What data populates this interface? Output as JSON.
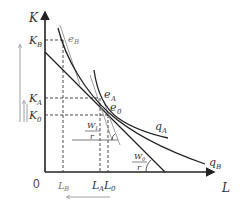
{
  "diagram": {
    "type": "isoquant-isocost",
    "axes": {
      "y_label": "K",
      "x_label": "L",
      "origin_label": "0"
    },
    "y_ticks": [
      {
        "base": "K",
        "sub": "B"
      },
      {
        "base": "K",
        "sub": "A"
      },
      {
        "base": "K",
        "sub": "0"
      }
    ],
    "x_ticks": [
      {
        "base": "L",
        "sub": "B"
      },
      {
        "base": "L",
        "sub": "A"
      },
      {
        "base": "L",
        "sub": "0"
      }
    ],
    "points": [
      {
        "base": "e",
        "sub": "B"
      },
      {
        "base": "e",
        "sub": "A"
      },
      {
        "base": "e",
        "sub": "0"
      }
    ],
    "curves": [
      {
        "base": "q",
        "sub": "A"
      },
      {
        "base": "q",
        "sub": "B"
      }
    ],
    "slopes": [
      {
        "num_base": "W",
        "num_sub": "1",
        "den": "r"
      },
      {
        "num_base": "W",
        "num_sub": "0",
        "den": "r"
      }
    ],
    "colors": {
      "axis": "#222222",
      "curve": "#222222",
      "dashed": "#333333",
      "arrow": "#888888"
    }
  }
}
